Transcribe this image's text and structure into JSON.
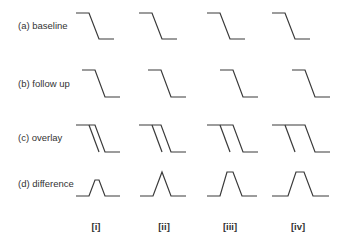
{
  "rows": [
    {
      "id": "a",
      "label": "(a)  baseline",
      "y": 26
    },
    {
      "id": "b",
      "label": "(b)  follow up",
      "y": 84
    },
    {
      "id": "c",
      "label": "(c)  overlay",
      "y": 138
    },
    {
      "id": "d",
      "label": "(d)  difference",
      "y": 185
    }
  ],
  "columns": [
    {
      "id": "i",
      "label": "[i]",
      "x": 96
    },
    {
      "id": "ii",
      "label": "[ii]",
      "x": 164
    },
    {
      "id": "iii",
      "label": "[iii]",
      "x": 230
    },
    {
      "id": "iv",
      "label": "[iv]",
      "x": 298
    }
  ],
  "colors": {
    "stroke": "#3a3a3a",
    "text": "#333333",
    "background": "#ffffff"
  }
}
